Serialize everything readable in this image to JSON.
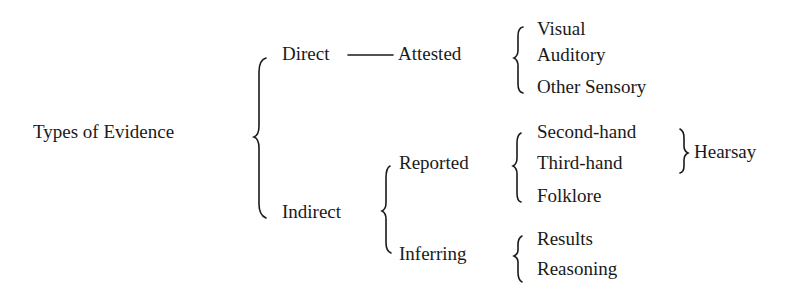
{
  "diagram": {
    "root": "Types of Evidence",
    "level1": {
      "direct": "Direct",
      "indirect": "Indirect"
    },
    "direct": {
      "attested": "Attested",
      "attested_items": [
        "Visual",
        "Auditory",
        "Other Sensory"
      ]
    },
    "indirect": {
      "reported": "Reported",
      "reported_items": [
        "Second-hand",
        "Third-hand",
        "Folklore"
      ],
      "hearsay": "Hearsay",
      "inferring": "Inferring",
      "inferring_items": [
        "Results",
        "Reasoning"
      ]
    }
  }
}
